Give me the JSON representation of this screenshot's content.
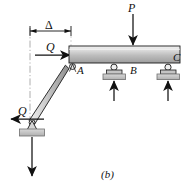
{
  "figure": {
    "caption": "(b)",
    "type": "structural-free-body-diagram"
  },
  "labels": {
    "load_P": "P",
    "force_Q_upper": "Q",
    "force_Q_lower": "Q",
    "dimension_delta": "Δ",
    "point_A": "A",
    "point_B": "B",
    "point_C": "C"
  },
  "colors": {
    "outline": "#1a1a1a",
    "beam_light": "#e8e8e8",
    "beam_dark": "#9a9a9a",
    "strut_light": "#dcdcdc",
    "strut_dark": "#8f8f8f",
    "ground": "#c9c9c9",
    "ground_edge": "#7d7d7d",
    "centerline": "#9b9b9b"
  },
  "elements": {
    "beam": "horizontal-beam",
    "strut": "inclined-two-force-member",
    "support_A": "pin-connection",
    "support_B": "roller-support",
    "support_C": "roller-support",
    "support_base": "pin-support-base",
    "reaction_B": "upward-reaction-arrow",
    "reaction_C": "upward-reaction-arrow",
    "reaction_base": "downward-reaction-arrow",
    "dimension_line": "delta-dimension-line",
    "centerline": "vertical-dash-dot-centerline"
  }
}
